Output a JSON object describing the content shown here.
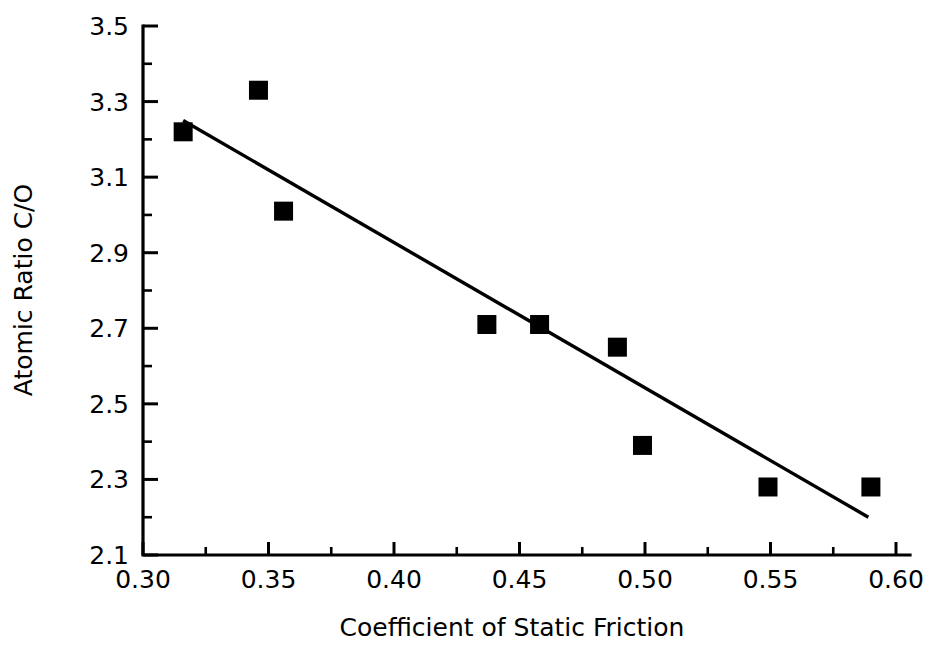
{
  "chart_data": {
    "type": "scatter",
    "title": "",
    "xlabel": "Coefficient of Static Friction",
    "ylabel": "Atomic Ratio C/O",
    "xlim": [
      0.3,
      0.6
    ],
    "ylim": [
      2.1,
      3.5
    ],
    "grid": false,
    "legend": null,
    "x_ticks": [
      0.3,
      0.35,
      0.4,
      0.45,
      0.5,
      0.55,
      0.6
    ],
    "x_tick_labels": [
      "0.30",
      "0.35",
      "0.40",
      "0.45",
      "0.50",
      "0.55",
      "0.60"
    ],
    "x_minor_ticks": [
      0.325,
      0.375,
      0.425,
      0.475,
      0.525,
      0.575
    ],
    "y_ticks": [
      2.1,
      2.3,
      2.5,
      2.7,
      2.9,
      3.1,
      3.3,
      3.5
    ],
    "y_tick_labels": [
      "2.1",
      "2.3",
      "2.5",
      "2.7",
      "2.9",
      "3.1",
      "3.3",
      "3.5"
    ],
    "y_minor_ticks": [
      2.2,
      2.4,
      2.6,
      2.8,
      3.0,
      3.2,
      3.4
    ],
    "marker": "filled-square",
    "marker_color": "#000000",
    "points": [
      {
        "x": 0.316,
        "y": 3.22
      },
      {
        "x": 0.346,
        "y": 3.33
      },
      {
        "x": 0.356,
        "y": 3.01
      },
      {
        "x": 0.437,
        "y": 2.71
      },
      {
        "x": 0.458,
        "y": 2.71
      },
      {
        "x": 0.489,
        "y": 2.65
      },
      {
        "x": 0.499,
        "y": 2.39
      },
      {
        "x": 0.549,
        "y": 2.28
      },
      {
        "x": 0.59,
        "y": 2.28
      }
    ],
    "series": [
      {
        "name": "data",
        "x": [
          0.316,
          0.346,
          0.356,
          0.437,
          0.458,
          0.489,
          0.499,
          0.549,
          0.59
        ],
        "values": [
          3.22,
          3.33,
          3.01,
          2.71,
          2.71,
          2.65,
          2.39,
          2.28,
          2.28
        ]
      }
    ],
    "trend_line": {
      "name": "linear-fit",
      "x_start": 0.316,
      "y_start": 3.25,
      "x_end": 0.589,
      "y_end": 2.2,
      "color": "#000000"
    }
  }
}
